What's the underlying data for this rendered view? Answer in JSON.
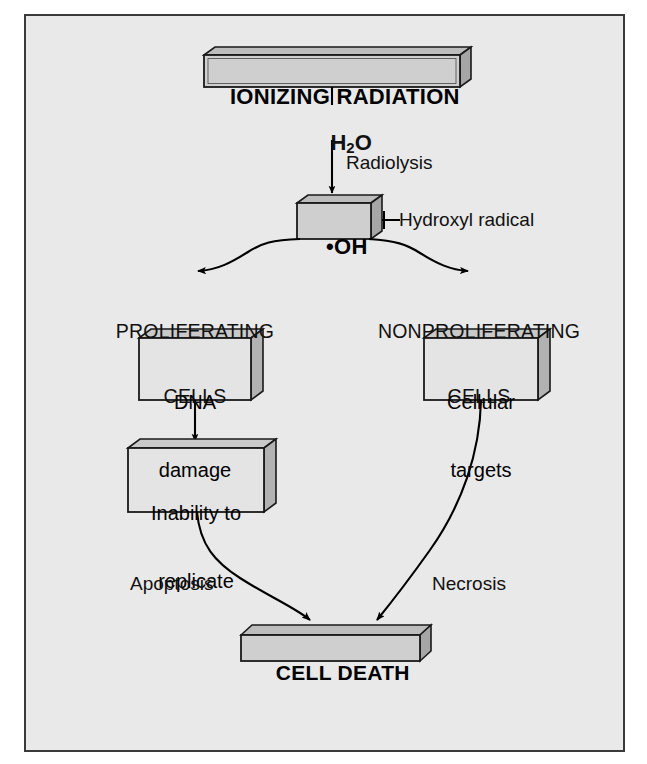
{
  "figure": {
    "background_color": "#e9e9e9",
    "border_color": "#3a3a3a",
    "page_background": "#ffffff"
  },
  "style": {
    "box_face_color": "#d4d4d4",
    "box_face_light": "#e2e2e2",
    "box_top_color": "#bdbdbd",
    "box_side_color": "#a9a9a9",
    "box_stroke": "#1a1a1a",
    "arrow_color": "#000000",
    "text_color": "#111111"
  },
  "boxes": [
    {
      "id": "ionizing-radiation",
      "label": "IONIZING RADIATION",
      "style": "shaded-bold",
      "lines": [
        "IONIZING RADIATION"
      ]
    },
    {
      "id": "hydroxyl-radical",
      "label": "•OH",
      "style": "shaded-bold",
      "lines": [
        "•OH"
      ]
    },
    {
      "id": "dna-damage",
      "label": "DNA damage",
      "style": "light",
      "lines": [
        "DNA",
        "damage"
      ]
    },
    {
      "id": "inability-to-replicate",
      "label": "Inability to replicate",
      "style": "light",
      "lines": [
        "Inability to",
        "replicate"
      ]
    },
    {
      "id": "cellular-targets",
      "label": "Cellular targets",
      "style": "light",
      "lines": [
        "Cellular",
        "targets"
      ]
    },
    {
      "id": "cell-death",
      "label": "CELL DEATH",
      "style": "shaded-bold",
      "lines": [
        "CELL DEATH"
      ]
    }
  ],
  "labels": {
    "water": "H₂O",
    "water_main": "H",
    "water_sub": "2",
    "water_tail": "O",
    "radiolysis": "Radiolysis",
    "hydroxyl_radical_callout": "Hydroxyl radical",
    "proliferating_line1": "PROLIFERATING",
    "proliferating_line2": "CELLS",
    "nonproliferating_line1": "NONPROLIFERATING",
    "nonproliferating_line2": "CELLS",
    "apoptosis": "Apoptosis",
    "necrosis": "Necrosis"
  },
  "box_text": {
    "ionizing_radiation": "IONIZING RADIATION",
    "hydroxyl": "•OH",
    "dna_l1": "DNA",
    "dna_l2": "damage",
    "inability_l1": "Inability to",
    "inability_l2": "replicate",
    "cellular_l1": "Cellular",
    "cellular_l2": "targets",
    "cell_death": "CELL DEATH"
  },
  "flow": {
    "edges": [
      {
        "from": "ionizing-radiation",
        "to": "hydroxyl-radical",
        "label": "Radiolysis",
        "via": "H₂O"
      },
      {
        "from": "hydroxyl-radical",
        "to": "proliferating-cells",
        "label": ""
      },
      {
        "from": "hydroxyl-radical",
        "to": "nonproliferating-cells",
        "label": ""
      },
      {
        "from": "dna-damage",
        "to": "inability-to-replicate",
        "label": ""
      },
      {
        "from": "inability-to-replicate",
        "to": "cell-death",
        "label": "Apoptosis"
      },
      {
        "from": "cellular-targets",
        "to": "cell-death",
        "label": "Necrosis"
      }
    ]
  }
}
